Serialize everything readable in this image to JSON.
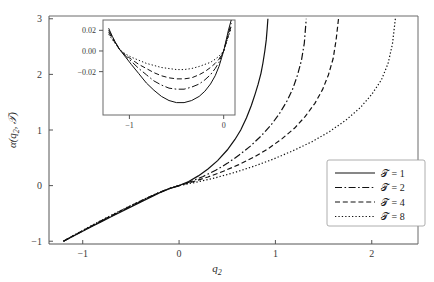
{
  "chart_data": {
    "type": "line",
    "title": "",
    "xlabel": "q_2",
    "ylabel": "alpha(q_2, T)",
    "xlim": [
      -1.35,
      2.48
    ],
    "ylim": [
      -1.05,
      3.05
    ],
    "xticks": [
      -1,
      0,
      1,
      2
    ],
    "xtick_labels": [
      "−1",
      "0",
      "1",
      "2"
    ],
    "yticks": [
      -1,
      0,
      1,
      2,
      3
    ],
    "ytick_labels": [
      "−1",
      "0",
      "1",
      "2",
      "3"
    ],
    "grid": false,
    "legend_position": "lower-right",
    "series": [
      {
        "name": "T = 1",
        "dash": "solid",
        "x": [
          -1.2,
          -1.15,
          -1.1,
          -1.0,
          -0.9,
          -0.8,
          -0.7,
          -0.6,
          -0.5,
          -0.4,
          -0.3,
          -0.2,
          -0.1,
          0.0,
          0.1,
          0.2,
          0.3,
          0.4,
          0.5,
          0.58,
          0.64,
          0.7,
          0.75,
          0.79,
          0.82,
          0.85,
          0.87,
          0.89,
          0.905,
          0.915,
          0.922
        ],
        "y": [
          -1.0,
          -0.955,
          -0.91,
          -0.82,
          -0.731,
          -0.643,
          -0.556,
          -0.469,
          -0.383,
          -0.297,
          -0.212,
          -0.127,
          -0.055,
          0.0,
          0.075,
          0.175,
          0.3,
          0.45,
          0.64,
          0.83,
          1.0,
          1.22,
          1.44,
          1.65,
          1.82,
          2.02,
          2.2,
          2.42,
          2.62,
          2.83,
          3.0
        ]
      },
      {
        "name": "T = 2",
        "dash": "dashdot",
        "x": [
          -1.2,
          -1.15,
          -1.1,
          -1.0,
          -0.9,
          -0.8,
          -0.7,
          -0.6,
          -0.5,
          -0.4,
          -0.3,
          -0.2,
          -0.1,
          0.0,
          0.12,
          0.25,
          0.38,
          0.5,
          0.62,
          0.74,
          0.85,
          0.95,
          1.04,
          1.12,
          1.18,
          1.23,
          1.27,
          1.3,
          1.32
        ],
        "y": [
          -1.0,
          -0.953,
          -0.906,
          -0.814,
          -0.723,
          -0.633,
          -0.544,
          -0.456,
          -0.37,
          -0.285,
          -0.202,
          -0.122,
          -0.053,
          0.0,
          0.072,
          0.165,
          0.275,
          0.4,
          0.545,
          0.71,
          0.89,
          1.08,
          1.29,
          1.52,
          1.74,
          1.99,
          2.25,
          2.56,
          3.0
        ]
      },
      {
        "name": "T = 4",
        "dash": "dashed",
        "x": [
          -1.2,
          -1.15,
          -1.1,
          -1.0,
          -0.9,
          -0.8,
          -0.7,
          -0.6,
          -0.5,
          -0.4,
          -0.3,
          -0.2,
          -0.1,
          0.0,
          0.14,
          0.3,
          0.46,
          0.62,
          0.78,
          0.93,
          1.07,
          1.2,
          1.31,
          1.41,
          1.49,
          1.55,
          1.6,
          1.63,
          1.655
        ],
        "y": [
          -1.0,
          -0.951,
          -0.903,
          -0.809,
          -0.716,
          -0.625,
          -0.536,
          -0.448,
          -0.362,
          -0.278,
          -0.197,
          -0.119,
          -0.052,
          0.0,
          0.068,
          0.155,
          0.258,
          0.378,
          0.515,
          0.67,
          0.845,
          1.035,
          1.245,
          1.48,
          1.73,
          1.99,
          2.29,
          2.62,
          3.0
        ]
      },
      {
        "name": "T = 8",
        "dash": "dotted",
        "x": [
          -1.2,
          -1.15,
          -1.1,
          -1.0,
          -0.9,
          -0.8,
          -0.7,
          -0.6,
          -0.5,
          -0.4,
          -0.3,
          -0.2,
          -0.1,
          0.0,
          0.18,
          0.38,
          0.58,
          0.78,
          0.98,
          1.18,
          1.38,
          1.56,
          1.73,
          1.88,
          2.0,
          2.1,
          2.17,
          2.215,
          2.245
        ],
        "y": [
          -1.0,
          -0.95,
          -0.901,
          -0.805,
          -0.711,
          -0.619,
          -0.53,
          -0.443,
          -0.357,
          -0.275,
          -0.195,
          -0.118,
          -0.051,
          0.0,
          0.062,
          0.142,
          0.238,
          0.35,
          0.478,
          0.625,
          0.79,
          0.97,
          1.175,
          1.4,
          1.64,
          1.9,
          2.2,
          2.55,
          3.0
        ]
      }
    ]
  },
  "inset": {
    "xlim": [
      -1.28,
      0.12
    ],
    "ylim": [
      -0.062,
      0.03
    ],
    "xticks": [
      -1,
      0
    ],
    "xtick_labels": [
      "−1",
      "0"
    ],
    "yticks": [
      0.02,
      0.0,
      -0.02
    ],
    "ytick_labels": [
      "0.02",
      "0.00",
      "−0.02"
    ],
    "series": [
      {
        "name": "T = 1",
        "dash": "solid",
        "x": [
          -1.22,
          -1.18,
          -1.14,
          -1.1,
          -1.04,
          -0.98,
          -0.9,
          -0.82,
          -0.74,
          -0.66,
          -0.58,
          -0.5,
          -0.42,
          -0.34,
          -0.26,
          -0.2,
          -0.14,
          -0.09,
          -0.05,
          -0.02,
          0.0,
          0.02,
          0.05,
          0.08
        ],
        "y": [
          0.022,
          0.014,
          0.007,
          0.001,
          -0.006,
          -0.013,
          -0.022,
          -0.031,
          -0.038,
          -0.044,
          -0.048,
          -0.05,
          -0.05,
          -0.048,
          -0.044,
          -0.039,
          -0.032,
          -0.024,
          -0.015,
          -0.006,
          0.0,
          0.008,
          0.02,
          0.03
        ]
      },
      {
        "name": "T = 2",
        "dash": "dashdot",
        "x": [
          -1.22,
          -1.18,
          -1.14,
          -1.1,
          -1.04,
          -0.98,
          -0.9,
          -0.82,
          -0.74,
          -0.66,
          -0.58,
          -0.5,
          -0.42,
          -0.34,
          -0.26,
          -0.2,
          -0.14,
          -0.09,
          -0.05,
          -0.02,
          0.0,
          0.02,
          0.05,
          0.08
        ],
        "y": [
          0.02,
          0.013,
          0.007,
          0.001,
          -0.005,
          -0.01,
          -0.017,
          -0.023,
          -0.029,
          -0.033,
          -0.036,
          -0.037,
          -0.037,
          -0.035,
          -0.032,
          -0.028,
          -0.023,
          -0.017,
          -0.011,
          -0.004,
          0.0,
          0.007,
          0.017,
          0.027
        ]
      },
      {
        "name": "T = 4",
        "dash": "dashed",
        "x": [
          -1.22,
          -1.18,
          -1.14,
          -1.1,
          -1.04,
          -0.98,
          -0.9,
          -0.82,
          -0.74,
          -0.66,
          -0.58,
          -0.5,
          -0.42,
          -0.34,
          -0.26,
          -0.2,
          -0.14,
          -0.09,
          -0.05,
          -0.02,
          0.0,
          0.02,
          0.05,
          0.08
        ],
        "y": [
          0.018,
          0.012,
          0.006,
          0.001,
          -0.004,
          -0.008,
          -0.013,
          -0.017,
          -0.021,
          -0.024,
          -0.026,
          -0.027,
          -0.027,
          -0.026,
          -0.023,
          -0.02,
          -0.016,
          -0.012,
          -0.008,
          -0.003,
          0.0,
          0.006,
          0.015,
          0.024
        ]
      },
      {
        "name": "T = 8",
        "dash": "dotted",
        "x": [
          -1.22,
          -1.18,
          -1.14,
          -1.1,
          -1.04,
          -0.98,
          -0.9,
          -0.82,
          -0.74,
          -0.66,
          -0.58,
          -0.5,
          -0.42,
          -0.34,
          -0.26,
          -0.2,
          -0.14,
          -0.09,
          -0.05,
          -0.02,
          0.0,
          0.02,
          0.05,
          0.08
        ],
        "y": [
          0.016,
          0.011,
          0.006,
          0.001,
          -0.003,
          -0.006,
          -0.009,
          -0.012,
          -0.014,
          -0.016,
          -0.017,
          -0.018,
          -0.018,
          -0.017,
          -0.015,
          -0.013,
          -0.011,
          -0.008,
          -0.005,
          -0.002,
          0.0,
          0.006,
          0.014,
          0.022
        ]
      }
    ]
  },
  "legend": {
    "entries": [
      {
        "label": "𝒯 = 1",
        "dash": "solid"
      },
      {
        "label": "𝒯 = 2",
        "dash": "dashdot"
      },
      {
        "label": "𝒯 = 4",
        "dash": "dashed"
      },
      {
        "label": "𝒯 = 8",
        "dash": "dotted"
      }
    ]
  },
  "axis_titles": {
    "x_main": "q",
    "x_sub": "2",
    "y_alpha": "α(",
    "y_q": "q",
    "y_sub": "2",
    "y_comma": ", ",
    "y_tcal": "𝒯",
    "y_close": ")"
  }
}
